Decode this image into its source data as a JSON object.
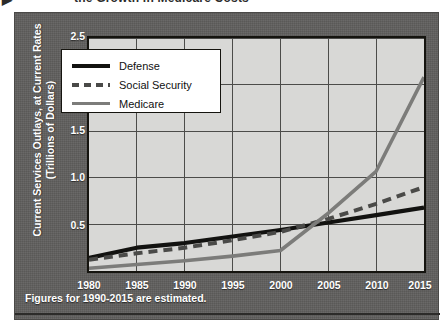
{
  "headline": {
    "bullet": "▶",
    "text": "the Growth in Medicare Costs"
  },
  "footnote": "Figures for 1990-2015 are estimated.",
  "legend": {
    "position": "inside-upper-left",
    "items": [
      {
        "label": "Defense",
        "key": "solid-thick",
        "color": "#121210"
      },
      {
        "label": "Social Security",
        "key": "dashed",
        "color": "#4a4a48"
      },
      {
        "label": "Medicare",
        "key": "solid-gray",
        "color": "#7c7c7a"
      }
    ]
  },
  "chart_data": {
    "type": "line",
    "title": "the Growth in Medicare Costs",
    "xlabel": "",
    "ylabel": "Current Services Outlays, at Current Rates (Trillions of Dollars)",
    "ylabel_lines": [
      "Current Services Outlays, at Current Rates",
      "(Trillions of Dollars)"
    ],
    "x": [
      1980,
      1985,
      1990,
      1995,
      2000,
      2005,
      2010,
      2015
    ],
    "xticklabels": [
      "1980",
      "1985",
      "1990",
      "1995",
      "2000",
      "2005",
      "2010",
      "2015"
    ],
    "xlim": [
      1980,
      2015
    ],
    "ylim": [
      0,
      2.5
    ],
    "yticks": [
      0.5,
      1.0,
      1.5,
      2.0,
      2.5
    ],
    "yticklabels": [
      "0.5",
      "1.0",
      "1.5",
      "2.0",
      "2.5"
    ],
    "grid": true,
    "annotation": "Figures for 1990-2015 are estimated.",
    "series": [
      {
        "name": "Defense",
        "style": "solid-thick",
        "color": "#121210",
        "values": [
          0.14,
          0.25,
          0.3,
          0.37,
          0.44,
          0.52,
          0.6,
          0.68
        ]
      },
      {
        "name": "Social Security",
        "style": "dashed",
        "color": "#4a4a48",
        "values": [
          0.12,
          0.19,
          0.25,
          0.33,
          0.42,
          0.56,
          0.72,
          0.9
        ]
      },
      {
        "name": "Medicare",
        "style": "solid-gray",
        "color": "#7c7c7a",
        "values": [
          0.03,
          0.07,
          0.11,
          0.16,
          0.22,
          0.62,
          1.07,
          2.08
        ]
      }
    ]
  }
}
